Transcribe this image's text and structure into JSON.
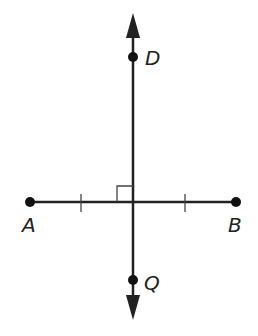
{
  "diagram": {
    "points": [
      {
        "name": "A",
        "label": "A"
      },
      {
        "name": "B",
        "label": "B"
      },
      {
        "name": "D",
        "label": "D"
      },
      {
        "name": "Q",
        "label": "Q"
      }
    ],
    "segments": [
      {
        "from": "A",
        "to": "B",
        "type": "segment",
        "tick_marks": 1
      },
      {
        "through": [
          "D",
          "Q"
        ],
        "type": "line",
        "arrows": "both"
      }
    ],
    "annotations": {
      "right_angle": "intersection of AB and line DQ"
    },
    "colors": {
      "stroke": "#222222",
      "background": "#ffffff"
    }
  }
}
